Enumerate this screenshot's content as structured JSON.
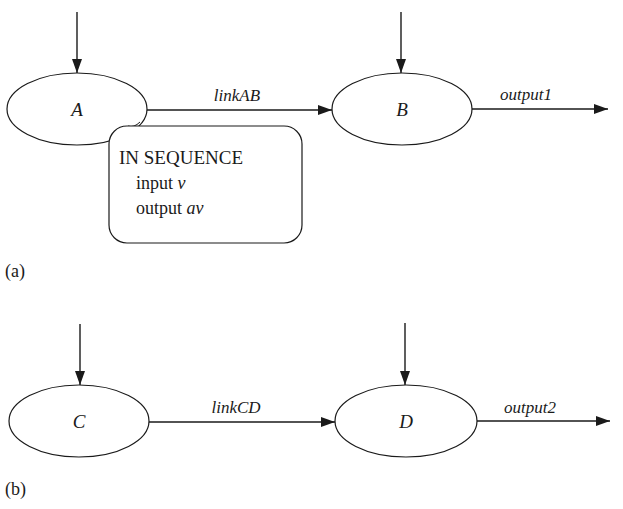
{
  "diagram_a": {
    "caption": "(a)",
    "nodes": [
      {
        "id": "A",
        "label": "A"
      },
      {
        "id": "B",
        "label": "B"
      }
    ],
    "edges": [
      {
        "from": "A",
        "to": "B",
        "label": "linkAB"
      },
      {
        "from": "B",
        "to": "out",
        "label": "output1"
      }
    ],
    "annotation": {
      "title": "IN SEQUENCE",
      "line1_kw": "input",
      "line1_var": "v",
      "line2_kw": "output",
      "line2_var": "av"
    }
  },
  "diagram_b": {
    "caption": "(b)",
    "nodes": [
      {
        "id": "C",
        "label": "C"
      },
      {
        "id": "D",
        "label": "D"
      }
    ],
    "edges": [
      {
        "from": "C",
        "to": "D",
        "label": "linkCD"
      },
      {
        "from": "D",
        "to": "out",
        "label": "output2"
      }
    ]
  },
  "colors": {
    "stroke": "#1a1a1a",
    "background": "#ffffff"
  }
}
